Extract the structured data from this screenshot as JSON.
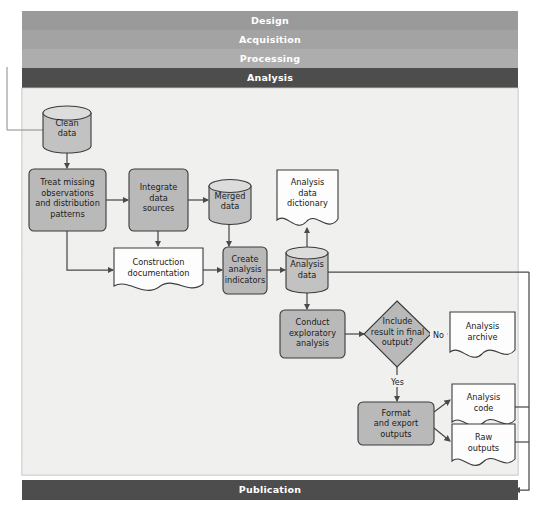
{
  "diagram": {
    "canvas": {
      "width": 544,
      "height": 510,
      "background": "#ffffff",
      "panel_background": "#f1f1ef"
    },
    "colors": {
      "phase_design": "#9a9a9a",
      "phase_acquisition": "#a2a2a2",
      "phase_processing": "#acacac",
      "phase_analysis": "#4d4d4d",
      "phase_publication": "#4d4d4d",
      "process_fill": "#b9b9b9",
      "document_fill": "#fdfdfd",
      "database_fill": "#c2c2c2",
      "stroke": "#3a3a3a",
      "connector": "#4a4a4a",
      "label_text": "#ffffff"
    },
    "phase_bars": [
      {
        "id": "design",
        "label": "Design",
        "active": false
      },
      {
        "id": "acquisition",
        "label": "Acquisition",
        "active": false
      },
      {
        "id": "processing",
        "label": "Processing",
        "active": false
      },
      {
        "id": "analysis",
        "label": "Analysis",
        "active": true
      }
    ],
    "footer_bar": {
      "id": "publication",
      "label": "Publication",
      "active": true
    },
    "nodes": [
      {
        "id": "clean-data",
        "shape": "database",
        "lines": [
          "Clean",
          "data"
        ]
      },
      {
        "id": "treat-missing",
        "shape": "process",
        "lines": [
          "Treat missing",
          "observations",
          "and distribution",
          "patterns"
        ]
      },
      {
        "id": "integrate-data",
        "shape": "process",
        "lines": [
          "Integrate",
          "data",
          "sources"
        ]
      },
      {
        "id": "merged-data",
        "shape": "database",
        "lines": [
          "Merged",
          "data"
        ]
      },
      {
        "id": "analysis-dictionary",
        "shape": "document",
        "lines": [
          "Analysis",
          "data",
          "dictionary"
        ]
      },
      {
        "id": "construction-doc",
        "shape": "document",
        "lines": [
          "Construction",
          "documentation"
        ]
      },
      {
        "id": "create-indicators",
        "shape": "process",
        "lines": [
          "Create",
          "analysis",
          "indicators"
        ]
      },
      {
        "id": "analysis-data",
        "shape": "database",
        "lines": [
          "Analysis",
          "data"
        ]
      },
      {
        "id": "conduct-exploratory",
        "shape": "process",
        "lines": [
          "Conduct",
          "exploratory",
          "analysis"
        ]
      },
      {
        "id": "include-decision",
        "shape": "decision",
        "lines": [
          "Include",
          "result in final",
          "output?"
        ]
      },
      {
        "id": "analysis-archive",
        "shape": "document",
        "lines": [
          "Analysis",
          "archive"
        ]
      },
      {
        "id": "format-export",
        "shape": "process",
        "lines": [
          "Format",
          "and export",
          "outputs"
        ]
      },
      {
        "id": "analysis-code",
        "shape": "document",
        "lines": [
          "Analysis",
          "code"
        ]
      },
      {
        "id": "raw-outputs",
        "shape": "document",
        "lines": [
          "Raw",
          "outputs"
        ]
      }
    ],
    "edge_labels": [
      {
        "id": "decision-no",
        "label": "No"
      },
      {
        "id": "decision-yes",
        "label": "Yes"
      }
    ]
  }
}
